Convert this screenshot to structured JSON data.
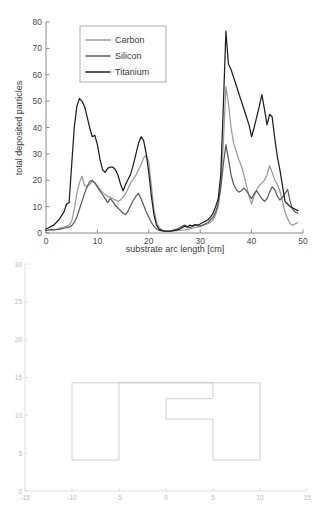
{
  "chart_data": [
    {
      "id": "deposition-profile",
      "type": "line",
      "title": "",
      "xlabel": "substrate arc length [cm]",
      "ylabel": "total deposited particles",
      "xlim": [
        0,
        50
      ],
      "ylim": [
        0,
        80
      ],
      "xticks": [
        0,
        10,
        20,
        30,
        40,
        50
      ],
      "yticks": [
        0,
        10,
        20,
        30,
        40,
        50,
        60,
        70,
        80
      ],
      "grid": false,
      "legend_position": "top-left-inset",
      "legend": [
        "Carbon",
        "Silicon",
        "Titanium"
      ],
      "colors": {
        "Carbon": "#9a9a9a",
        "Silicon": "#5c5c5c",
        "Titanium": "#1f1f1f"
      },
      "x": [
        0,
        0.5,
        1,
        1.5,
        2,
        2.5,
        3,
        3.5,
        4,
        4.5,
        5,
        5.5,
        6,
        6.5,
        7,
        7.5,
        8,
        8.5,
        9,
        9.5,
        10,
        10.5,
        11,
        11.5,
        12,
        12.5,
        13,
        13.5,
        14,
        14.5,
        15,
        15.5,
        16,
        16.5,
        17,
        17.5,
        18,
        18.5,
        19,
        19.5,
        20,
        20.5,
        21,
        21.5,
        22,
        22.5,
        23,
        23.5,
        24,
        24.5,
        25,
        25.5,
        26,
        26.5,
        27,
        27.5,
        28,
        28.5,
        29,
        29.5,
        30,
        30.5,
        31,
        31.5,
        32,
        32.5,
        33,
        33.5,
        34,
        34.5,
        35,
        35.5,
        36,
        36.5,
        37,
        37.5,
        38,
        38.5,
        39,
        39.5,
        40,
        40.5,
        41,
        41.5,
        42,
        42.5,
        43,
        43.5,
        44,
        44.5,
        45,
        45.5,
        46,
        46.5,
        47,
        47.5,
        48,
        48.5,
        49
      ],
      "series": [
        {
          "name": "Carbon",
          "color": "#9a9a9a",
          "values": [
            1.0,
            1.2,
            1.5,
            1.2,
            1.4,
            1.8,
            2.0,
            2.2,
            2.6,
            3.0,
            4.5,
            9.0,
            15.0,
            19.0,
            21.5,
            18.0,
            17.5,
            18.5,
            19.5,
            19.0,
            18.0,
            16.5,
            15.5,
            14.5,
            14.0,
            13.5,
            13.0,
            12.5,
            12.0,
            12.5,
            13.5,
            15.0,
            17.0,
            19.0,
            20.5,
            22.0,
            24.0,
            26.0,
            28.5,
            29.5,
            27.0,
            18.0,
            9.0,
            4.0,
            2.0,
            1.2,
            0.8,
            0.6,
            0.6,
            0.7,
            0.8,
            0.9,
            1.0,
            1.1,
            1.2,
            1.4,
            1.6,
            1.8,
            2.0,
            2.2,
            2.5,
            3.0,
            3.2,
            3.5,
            4.0,
            5.0,
            7.0,
            10.0,
            18.0,
            34.0,
            55.5,
            49.0,
            40.0,
            34.0,
            31.0,
            28.0,
            25.5,
            22.0,
            18.0,
            14.0,
            11.0,
            14.0,
            16.5,
            18.0,
            19.0,
            20.0,
            22.0,
            25.5,
            23.0,
            20.0,
            18.5,
            16.0,
            12.0,
            8.0,
            5.5,
            3.5,
            3.0,
            3.5,
            4.0,
            4.5,
            5.0
          ]
        },
        {
          "name": "Silicon",
          "color": "#5c5c5c",
          "values": [
            1.0,
            1.1,
            1.3,
            1.2,
            1.3,
            1.4,
            1.6,
            1.8,
            2.0,
            2.2,
            2.8,
            4.0,
            6.0,
            9.0,
            12.0,
            15.0,
            17.5,
            19.5,
            20.0,
            19.0,
            17.5,
            16.0,
            14.5,
            13.0,
            11.5,
            13.0,
            12.0,
            10.5,
            9.5,
            8.5,
            7.5,
            7.0,
            8.5,
            10.5,
            12.5,
            14.0,
            15.0,
            13.0,
            10.5,
            8.0,
            6.0,
            4.0,
            2.5,
            1.5,
            1.0,
            0.8,
            0.6,
            0.6,
            0.7,
            0.9,
            1.2,
            1.5,
            2.0,
            2.5,
            3.0,
            2.5,
            2.0,
            2.5,
            3.0,
            2.8,
            2.6,
            3.0,
            3.5,
            4.0,
            5.0,
            6.0,
            8.0,
            11.0,
            17.0,
            26.0,
            33.5,
            28.0,
            22.0,
            18.5,
            16.5,
            15.5,
            16.0,
            17.0,
            16.0,
            14.5,
            13.0,
            15.0,
            16.0,
            14.5,
            13.0,
            12.0,
            13.0,
            15.5,
            17.5,
            16.5,
            14.0,
            12.5,
            13.5,
            15.0,
            16.5,
            12.0,
            9.0,
            8.0,
            7.5,
            8.0,
            8.5
          ]
        },
        {
          "name": "Titanium",
          "color": "#1f1f1f",
          "values": [
            1.5,
            2.0,
            2.5,
            3.0,
            4.0,
            5.0,
            6.5,
            8.0,
            11.0,
            11.5,
            26.0,
            40.0,
            48.0,
            51.0,
            50.0,
            48.0,
            44.0,
            40.0,
            36.5,
            37.0,
            33.5,
            28.0,
            24.0,
            23.0,
            24.5,
            25.0,
            25.0,
            24.0,
            22.0,
            18.5,
            16.0,
            18.5,
            20.5,
            22.5,
            26.0,
            30.0,
            34.0,
            36.5,
            35.0,
            30.0,
            23.0,
            14.0,
            7.0,
            3.0,
            1.5,
            1.0,
            0.8,
            0.7,
            0.7,
            0.8,
            1.0,
            1.2,
            1.5,
            2.0,
            2.6,
            2.2,
            3.0,
            2.6,
            3.2,
            3.0,
            3.4,
            4.0,
            4.5,
            5.0,
            6.0,
            7.5,
            10.0,
            13.0,
            22.0,
            48.0,
            76.5,
            64.0,
            62.0,
            59.0,
            56.0,
            53.0,
            50.0,
            47.0,
            44.0,
            41.0,
            36.5,
            40.0,
            44.0,
            48.0,
            52.5,
            47.0,
            41.0,
            45.0,
            44.0,
            36.0,
            29.0,
            24.0,
            18.0,
            12.0,
            11.0,
            10.0,
            9.5,
            9.0,
            8.5,
            8.5,
            8.5
          ]
        }
      ]
    },
    {
      "id": "substrate-geometry",
      "type": "line",
      "title": "",
      "xlabel": "",
      "ylabel": "",
      "xlim": [
        -15,
        15
      ],
      "ylim": [
        0,
        30
      ],
      "xticks": [
        -15,
        -10,
        -5,
        0,
        5,
        10,
        15
      ],
      "yticks": [
        0,
        5,
        10,
        15,
        20,
        25,
        30
      ],
      "grid": false,
      "legend": [],
      "shapes": [
        {
          "name": "left-block",
          "points": [
            [
              -10,
              4.1
            ],
            [
              -10,
              14.3
            ],
            [
              -5,
              14.3
            ],
            [
              -5,
              4.1
            ],
            [
              -10,
              4.1
            ]
          ]
        },
        {
          "name": "right-notched-block",
          "points": [
            [
              -5,
              14.3
            ],
            [
              10,
              14.3
            ],
            [
              10,
              4.1
            ],
            [
              5,
              4.1
            ],
            [
              5,
              9.5
            ],
            [
              0,
              9.5
            ],
            [
              0,
              12.2
            ],
            [
              5,
              12.2
            ],
            [
              5,
              14.3
            ],
            [
              -5,
              14.3
            ]
          ]
        }
      ]
    }
  ],
  "top_chart": {
    "ylabel": "total deposited particles",
    "xlabel": "substrate arc length [cm]",
    "xtick_labels": [
      "0",
      "10",
      "20",
      "30",
      "40",
      "50"
    ],
    "ytick_labels": [
      "0",
      "10",
      "20",
      "30",
      "40",
      "50",
      "60",
      "70",
      "80"
    ],
    "legend_items": [
      {
        "label": "Carbon",
        "color": "#9a9a9a"
      },
      {
        "label": "Silicon",
        "color": "#5c5c5c"
      },
      {
        "label": "Titanium",
        "color": "#1f1f1f"
      }
    ]
  },
  "bottom_chart": {
    "xtick_labels": [
      "-15",
      "-10",
      "-5",
      "0",
      "5",
      "10",
      "15"
    ],
    "ytick_labels": [
      "0",
      "5",
      "10",
      "15",
      "20",
      "25",
      "30"
    ]
  }
}
